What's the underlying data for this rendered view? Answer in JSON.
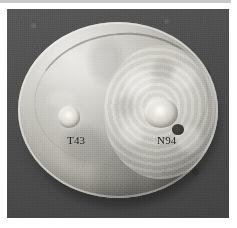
{
  "figure": {
    "kind": "photograph",
    "background_color": "#4e4e4e",
    "dish_color": "#c4c2bb",
    "label_color": "#121212"
  },
  "rule": {
    "color": "#c9c9c9"
  },
  "labels": {
    "left": "T43",
    "right": "N94"
  },
  "colonies": [
    {
      "id": "T43",
      "label": "T43",
      "position": "left",
      "size": "small"
    },
    {
      "id": "N94",
      "label": "N94",
      "position": "right",
      "size": "large"
    }
  ]
}
